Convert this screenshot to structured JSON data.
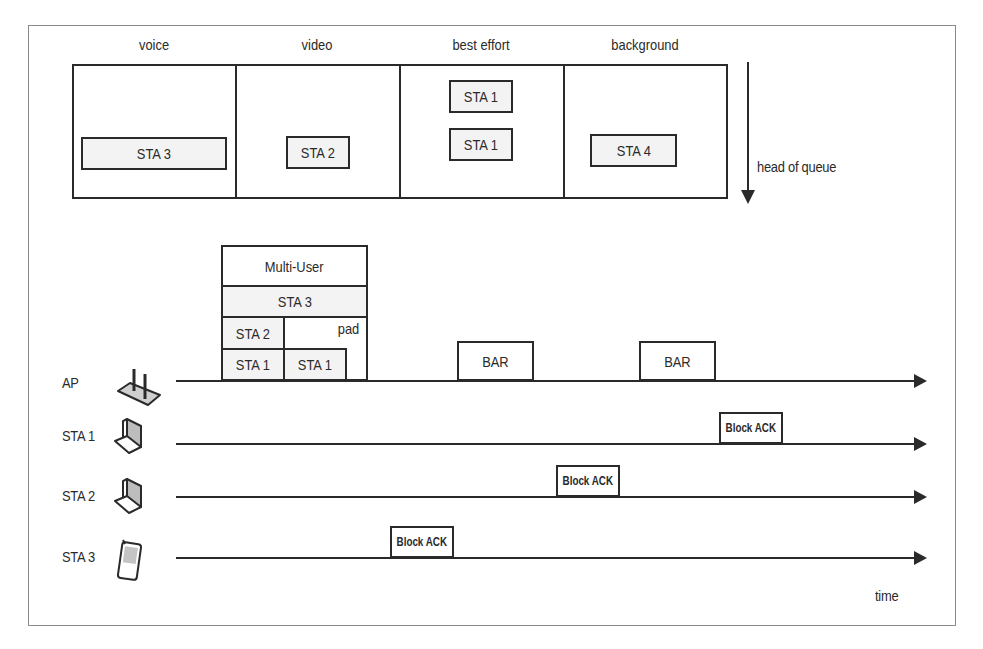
{
  "queues": {
    "columns": [
      {
        "label": "voice",
        "frames": [
          "STA 3"
        ]
      },
      {
        "label": "video",
        "frames": [
          "STA 2"
        ]
      },
      {
        "label": "best effort",
        "frames": [
          "STA 1",
          "STA 1"
        ]
      },
      {
        "label": "background",
        "frames": [
          "STA 4"
        ]
      }
    ],
    "head_of_queue_label": "head of queue"
  },
  "mu_frame": {
    "header": "Multi-User",
    "row_sta3": "STA 3",
    "row_sta2": "STA 2",
    "pad": "pad",
    "sta1_a": "STA 1",
    "sta1_b": "STA 1"
  },
  "timeline": {
    "rows": [
      {
        "label": "AP",
        "icon": "access-point-icon"
      },
      {
        "label": "STA 1",
        "icon": "laptop-icon"
      },
      {
        "label": "STA 2",
        "icon": "laptop-icon"
      },
      {
        "label": "STA 3",
        "icon": "phone-icon"
      }
    ],
    "bar_1": "BAR",
    "bar_2": "BAR",
    "ack_sta1": "Block ACK",
    "ack_sta2": "Block ACK",
    "ack_sta3": "Block ACK",
    "axis_label": "time"
  },
  "colors": {
    "line": "#2a2a2a",
    "frame_fill": "#f3f3f3",
    "border": "#8a8a8a"
  }
}
